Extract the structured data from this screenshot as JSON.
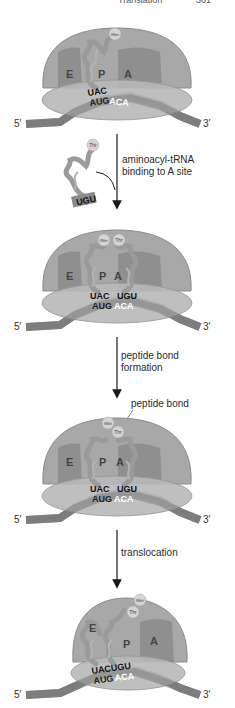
{
  "header": {
    "title": "Translation",
    "page_number": "361"
  },
  "colors": {
    "large_subunit": "#a8a8a8",
    "large_subunit_stroke": "#8c8c8c",
    "small_subunit": "#b9b9b9",
    "site_fill": "#8a8a8a",
    "mrna": "#7d7d7d",
    "trna": "#9a9a9a",
    "amino_acid": "#d4d4d4",
    "arrow": "#1a1a1a",
    "text": "#2a2a2a",
    "codon_light": "#ffffff"
  },
  "stages": [
    {
      "name": "initiation-complex",
      "sites": [
        "E",
        "P",
        "A"
      ],
      "amino_acids": [
        "fMet"
      ],
      "anticodons": [
        "UAC"
      ],
      "codons": [
        "AUG",
        "ACA"
      ],
      "five_prime": "5′",
      "three_prime": "3′"
    },
    {
      "name": "after-aminoacyl-binding",
      "sites": [
        "E",
        "P",
        "A"
      ],
      "amino_acids": [
        "fMet",
        "Thr"
      ],
      "anticodons": [
        "UAC",
        "UGU"
      ],
      "codons": [
        "AUG",
        "ACA"
      ],
      "five_prime": "5′",
      "three_prime": "3′"
    },
    {
      "name": "after-peptide-bond",
      "sites": [
        "E",
        "P",
        "A"
      ],
      "amino_acids": [
        "fMet",
        "Thr"
      ],
      "anticodons": [
        "UAC",
        "UGU"
      ],
      "codons": [
        "AUG",
        "ACA"
      ],
      "callout": "peptide bond",
      "five_prime": "5′",
      "three_prime": "3′"
    },
    {
      "name": "after-translocation",
      "sites": [
        "E",
        "P",
        "A"
      ],
      "amino_acids": [
        "fMet",
        "Thr"
      ],
      "anticodons": [
        "UACUGU"
      ],
      "codons": [
        "AUG",
        "ACA"
      ],
      "five_prime": "5′",
      "three_prime": "3′"
    }
  ],
  "incoming_trna": {
    "amino_acid": "Thr",
    "anticodon": "UGU"
  },
  "steps": [
    {
      "line1": "aminoacyl-tRNA",
      "line2": "binding to A site"
    },
    {
      "line1": "peptide bond",
      "line2": "formation"
    },
    {
      "line1": "translocation",
      "line2": ""
    }
  ]
}
